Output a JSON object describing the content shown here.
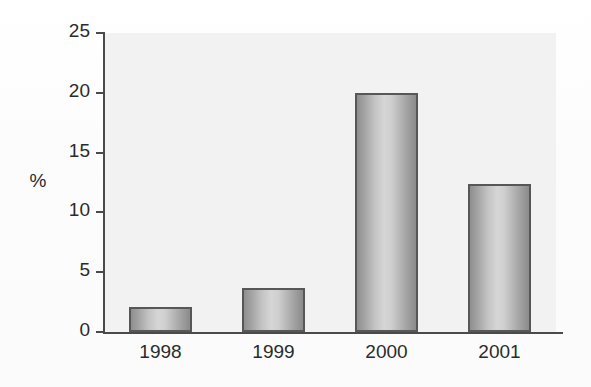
{
  "chart_data": {
    "type": "bar",
    "title": "",
    "subtitle": "",
    "xlabel": "",
    "ylabel": "%",
    "categories": [
      "1998",
      "1999",
      "2000",
      "2001"
    ],
    "values": [
      2.1,
      3.7,
      20.0,
      12.4
    ],
    "ylim": [
      0,
      25
    ],
    "y_ticks": [
      "0",
      "5",
      "10",
      "15",
      "20",
      "25"
    ],
    "y_tick_values": [
      0,
      5,
      10,
      15,
      20,
      25
    ],
    "grid": false,
    "legend": "none",
    "legend_position": "none",
    "bar_fill_color": "#c0c0c0",
    "bar_border_color": "#575757",
    "plot_background_color": "#f2f2f2",
    "axis_color": "#4a4a4a",
    "text_color": "#2b2b2b"
  },
  "axis": {
    "y_title": "%"
  }
}
